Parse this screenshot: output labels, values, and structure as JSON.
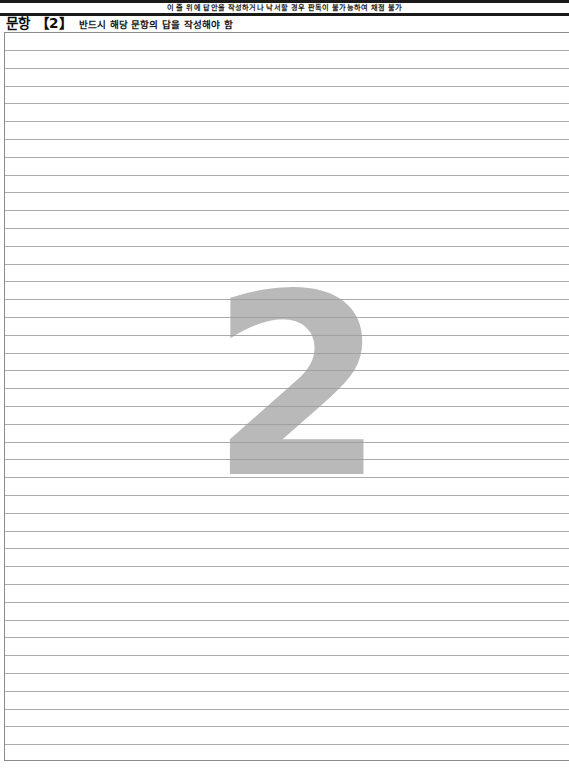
{
  "document": {
    "type": "answer-sheet",
    "warning_notice": "이 줄 위에 답안을 작성하거나 낙서할 경우 판독이 불가능하여 채점 불가",
    "question_label": "문항 【2】",
    "question_number": "2",
    "instruction": "반드시 해당 문항의 답을 작성해야 함",
    "watermark_digit": "2",
    "answer_text": ""
  },
  "layout": {
    "ruled_line_count": 41,
    "first_line_offset_px": 17,
    "line_spacing_px": 17.8
  },
  "colors": {
    "page_background": "#ffffff",
    "header_rule": "#1a1a1a",
    "text": "#111111",
    "rule_line": "#9a9aa0",
    "watermark": "#b9b9b9",
    "box_border": "#8c8c90"
  }
}
